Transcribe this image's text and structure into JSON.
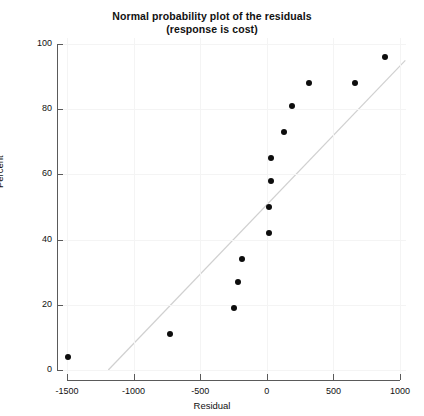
{
  "chart_data": {
    "type": "scatter",
    "title": "Normal probability plot of the residuals",
    "subtitle": "(response is cost)",
    "xlabel": "Residual",
    "ylabel": "Percent",
    "xlim": [
      -1500,
      1000
    ],
    "ylim": [
      0,
      100
    ],
    "xticks": [
      -1500,
      -1000,
      -500,
      0,
      500,
      1000
    ],
    "xtick_labels": [
      "-1500",
      "-1000",
      "-500",
      "0",
      "500",
      "1000"
    ],
    "yticks": [
      0,
      20,
      40,
      60,
      80,
      100
    ],
    "ytick_labels": [
      "0",
      "20",
      "40",
      "60",
      "80",
      "100"
    ],
    "grid": true,
    "legend": "none",
    "marker_color": "#0d0d0d",
    "line_color": "#d0d0d0",
    "points": [
      {
        "x": -1495,
        "y": 4
      },
      {
        "x": -725,
        "y": 11
      },
      {
        "x": -250,
        "y": 19
      },
      {
        "x": -215,
        "y": 27
      },
      {
        "x": -185,
        "y": 34
      },
      {
        "x": 15,
        "y": 42
      },
      {
        "x": 20,
        "y": 50
      },
      {
        "x": 30,
        "y": 58
      },
      {
        "x": 35,
        "y": 65
      },
      {
        "x": 130,
        "y": 73
      },
      {
        "x": 190,
        "y": 81
      },
      {
        "x": 320,
        "y": 88
      },
      {
        "x": 660,
        "y": 88
      },
      {
        "x": 890,
        "y": 96
      }
    ],
    "reference_line": {
      "x0": -1190,
      "y0": 0,
      "x1": 1040,
      "y1": 95
    }
  },
  "figure": {
    "background": "#ffffff"
  }
}
